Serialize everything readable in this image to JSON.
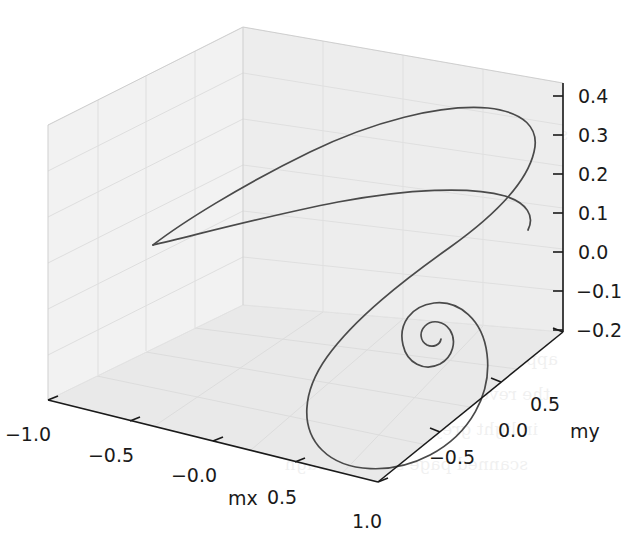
{
  "figure": {
    "type": "3d-line-plot",
    "background_color": "#ffffff",
    "line_color": "#4a4a4a",
    "pane_color_left": "#f2f2f2",
    "pane_color_back": "#ededed",
    "pane_color_floor": "#e9e9e9",
    "grid_color": "#e0e0e0",
    "axis_color": "#1a1a1a",
    "tick_label_color": "#1a1a1a"
  },
  "axes": {
    "x": {
      "label": "mx",
      "ticks": [
        "−1.0",
        "−0.5",
        "−0.0",
        "0.5",
        "1.0"
      ],
      "values": [
        -1.0,
        -0.5,
        -0.0,
        0.5,
        1.0
      ],
      "range": [
        -1.0,
        1.0
      ]
    },
    "y": {
      "label": "my",
      "ticks": [
        "−0.5",
        "0.0",
        "0.5"
      ],
      "values": [
        -0.5,
        0.0,
        0.5
      ],
      "range": [
        -1.0,
        1.0
      ]
    },
    "z": {
      "label": "",
      "ticks": [
        "0.4",
        "0.3",
        "0.2",
        "0.1",
        "0.0",
        "−0.1",
        "−0.2"
      ],
      "values": [
        0.4,
        0.3,
        0.2,
        0.1,
        0.0,
        -0.1,
        -0.2
      ],
      "range": [
        -0.2,
        0.4
      ]
    }
  },
  "chart_data": {
    "type": "line",
    "title": "",
    "xlabel": "mx",
    "ylabel": "my",
    "zlabel": "",
    "xlim": [
      -1.0,
      1.0
    ],
    "ylim": [
      -1.0,
      1.0
    ],
    "zlim": [
      -0.2,
      0.4
    ],
    "grid": true,
    "legend": "none",
    "series": [
      {
        "name": "magnetization trajectory",
        "description": "Damped precessional spiral converging to a fixed point",
        "projected_path": "M153,245 C180,224 240,186 310,152 C372,122 440,104 488,108 C524,112 540,128 534,152 C527,182 494,216 449,248 C404,280 355,318 327,357 C302,392 300,428 322,450 C345,473 392,475 430,455 C470,434 492,394 487,354 C483,320 459,300 434,303 C411,306 398,324 403,345 C407,363 424,372 440,364 C453,357 457,341 450,330 C444,321 432,319 425,326 C419,332 420,341 427,345 C433,348 440,345 441,339",
        "cusp_point_px": [
          153,
          245
        ],
        "convergence_point_px": [
          470,
          318
        ]
      },
      {
        "name": "upper lobe return branch",
        "projected_path": "M153,245 C196,235 266,216 338,202 C408,189 470,186 505,196 C527,203 535,216 528,230"
      }
    ]
  },
  "bleed_through_text": {
    "note": "faint reversed text showing through from the reverse side of the scanned page",
    "lines": [
      "the reversed text is illegible",
      "scanned page show-through",
      "appears behind the figure",
      "in light grey tones only"
    ]
  }
}
